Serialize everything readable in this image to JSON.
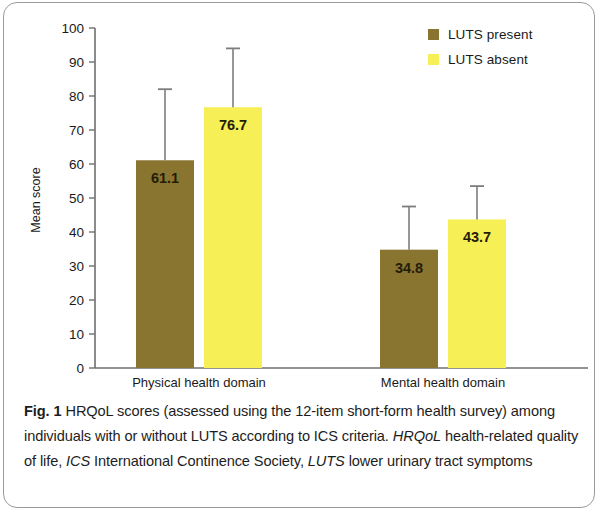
{
  "figure": {
    "caption_label": "Fig. 1",
    "caption_line1": " HRQoL scores (assessed using the 12-item short-form health",
    "caption_line2": "survey) among individuals with or without LUTS according to ICS criteria.",
    "abbr1": "HRQoL",
    "abbr1_text": " health-related quality of life, ",
    "abbr2": "ICS",
    "abbr2_text": " International Continence Society,",
    "abbr3": "LUTS",
    "abbr3_text": " lower urinary tract symptoms"
  },
  "legend": {
    "items": [
      {
        "label": "LUTS present",
        "color": "#8a7530"
      },
      {
        "label": "LUTS absent",
        "color": "#f6ef55"
      }
    ]
  },
  "chart_data": {
    "type": "bar",
    "title": "",
    "xlabel": "",
    "ylabel": "Mean score",
    "ylim": [
      0,
      100
    ],
    "yticks": [
      0,
      10,
      20,
      30,
      40,
      50,
      60,
      70,
      80,
      90,
      100
    ],
    "ytick_labels": [
      "0",
      "10",
      "20",
      "30",
      "40",
      "50",
      "60",
      "70",
      "80",
      "90",
      "100"
    ],
    "grid": false,
    "legend_position": "top-right",
    "categories": [
      "Physical health domain",
      "Mental health domain"
    ],
    "series": [
      {
        "name": "LUTS present",
        "color": "#8a7530",
        "values": [
          61.1,
          34.8
        ],
        "value_labels": [
          "61.1",
          "34.8"
        ],
        "error_upper": [
          82.0,
          47.5
        ]
      },
      {
        "name": "LUTS absent",
        "color": "#f6ef55",
        "values": [
          76.7,
          43.7
        ],
        "value_labels": [
          "76.7",
          "43.7"
        ],
        "error_upper": [
          94.0,
          53.5
        ]
      }
    ]
  }
}
